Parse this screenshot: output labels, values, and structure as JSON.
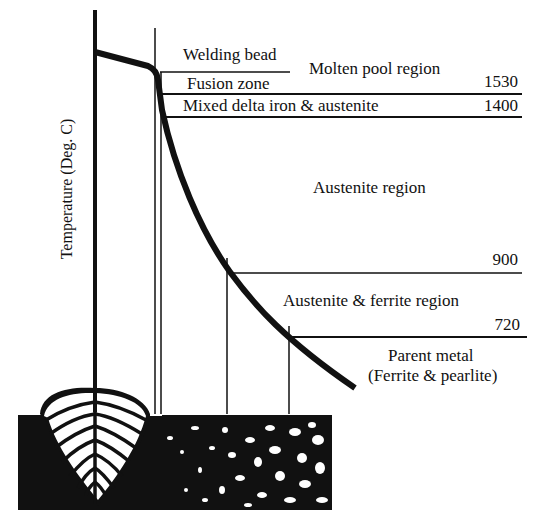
{
  "diagram": {
    "y_axis_label": "Temperature (Deg. C)",
    "regions": {
      "welding_bead": "Welding bead",
      "fusion_zone": "Fusion zone",
      "molten_pool": "Molten pool region",
      "mixed_delta": "Mixed delta iron & austenite",
      "austenite": "Austenite region",
      "austenite_ferrite": "Austenite & ferrite region",
      "parent_metal_line1": "Parent metal",
      "parent_metal_line2": "(Ferrite & pearlite)"
    },
    "temperatures": {
      "t1530": "1530",
      "t1400": "1400",
      "t900": "900",
      "t720": "720"
    },
    "colors": {
      "ink": "#111111",
      "background": "#ffffff"
    }
  }
}
